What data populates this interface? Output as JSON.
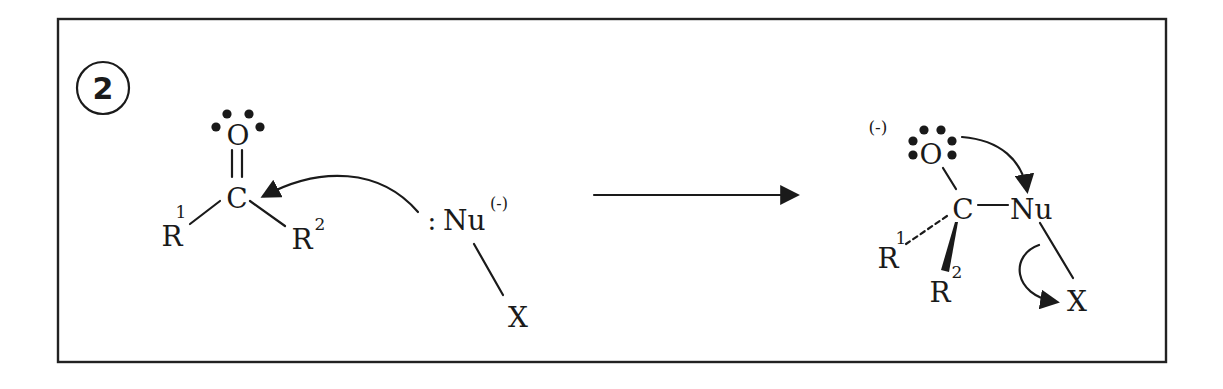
{
  "figure": {
    "type": "reaction-mechanism",
    "step_label": "2",
    "colors": {
      "ink": "#1a1a1a",
      "background": "#ffffff",
      "frame": "#222222"
    }
  },
  "reactant": {
    "oxygen": "O",
    "carbon": "C",
    "r1": "R",
    "r1_sup": "1",
    "r2": "R",
    "r2_sup": "2",
    "nucleophile_lone_pair": ":",
    "nucleophile": "Nu",
    "nucleophile_charge": "(-)",
    "leaving_group": "X"
  },
  "reaction_arrow": {
    "direction": "right"
  },
  "product": {
    "oxygen_charge": "(-)",
    "oxygen": "O",
    "carbon": "C",
    "nucleophile": "Nu",
    "r1": "R",
    "r1_sup": "1",
    "r2": "R",
    "r2_sup": "2",
    "leaving_group": "X"
  }
}
